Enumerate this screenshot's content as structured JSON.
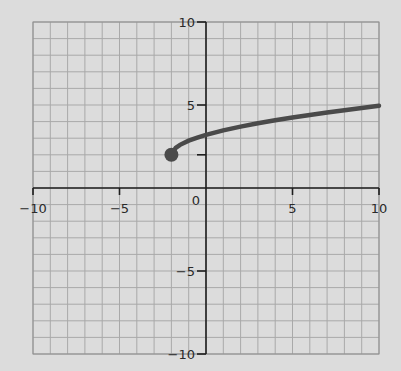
{
  "chart_data": {
    "type": "line",
    "title": "",
    "xlabel": "",
    "ylabel": "",
    "xlim": [
      -10,
      10
    ],
    "ylim": [
      -10,
      10
    ],
    "grid": true,
    "grid_step": 1,
    "x_ticks": [
      -10,
      -5,
      5,
      10
    ],
    "x_tick_labels": [
      "−10",
      "−5",
      "5",
      "10"
    ],
    "y_ticks": [
      10,
      5,
      -5,
      -10
    ],
    "y_tick_labels": [
      "10",
      "5",
      "−5",
      "−10"
    ],
    "origin_label": "0",
    "extra_y_ticks": [
      2
    ],
    "series": [
      {
        "name": "curve",
        "description": "square-root-shaped curve starting at closed point (-2, 2) and increasing to about (10, 4.95)",
        "start_point": {
          "x": -2,
          "y": 2,
          "closed": true
        },
        "points": [
          [
            -2,
            2.0
          ],
          [
            -1.75,
            2.42
          ],
          [
            -1.5,
            2.6
          ],
          [
            -1,
            2.85
          ],
          [
            -0.5,
            3.03
          ],
          [
            0,
            3.2
          ],
          [
            1,
            3.47
          ],
          [
            2,
            3.7
          ],
          [
            3,
            3.9
          ],
          [
            4,
            4.08
          ],
          [
            5,
            4.25
          ],
          [
            6,
            4.4
          ],
          [
            7,
            4.55
          ],
          [
            8,
            4.69
          ],
          [
            9,
            4.82
          ],
          [
            10,
            4.95
          ]
        ],
        "color": "#4a4a4a"
      }
    ]
  },
  "colors": {
    "background": "#dcdcdc",
    "grid": "#a9a9a9",
    "axis": "#1e1e1e",
    "curve": "#4a4a4a"
  }
}
